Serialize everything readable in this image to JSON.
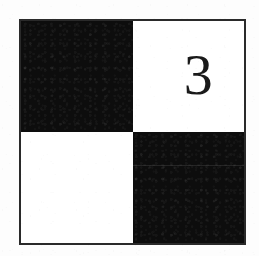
{
  "image": {
    "kind": "scanned-figure",
    "description": "Two-by-two checkerboard tile with a numeral in the upper-right square",
    "width": 259,
    "height": 256,
    "background_color": "#fdfdfd"
  },
  "tile": {
    "frame": {
      "border_color": "#2a2a2a",
      "border_width": 2,
      "fill_color": "#ffffff",
      "left": 19,
      "top": 19,
      "width": 227,
      "height": 226
    },
    "grid": {
      "rows": 2,
      "columns": 2
    },
    "colors": {
      "dark": "#0d0d0d",
      "light": "#ffffff",
      "ink": "#1a1a1a"
    },
    "cells": [
      {
        "position": "top-left",
        "tone": "dark",
        "label": ""
      },
      {
        "position": "top-right",
        "tone": "light",
        "label": "3"
      },
      {
        "position": "bottom-left",
        "tone": "light",
        "label": ""
      },
      {
        "position": "bottom-right",
        "tone": "dark",
        "label": ""
      }
    ]
  },
  "numeral": {
    "value": "3",
    "color": "#1a1a1a",
    "size_px": 58,
    "cell": "top-right"
  }
}
